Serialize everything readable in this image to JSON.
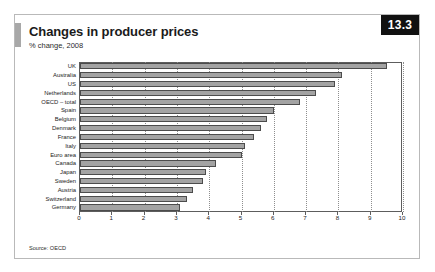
{
  "figure": {
    "badge": "13.3",
    "title": "Changes in producer prices",
    "subtitle": "% change, 2008",
    "source": "Source: OECD"
  },
  "chart_data": {
    "type": "bar",
    "orientation": "horizontal",
    "title": "Changes in producer prices",
    "subtitle": "% change, 2008",
    "xlabel": "",
    "ylabel": "",
    "xlim": [
      0,
      10
    ],
    "xticks": [
      0,
      1,
      2,
      3,
      4,
      5,
      6,
      7,
      8,
      9,
      10
    ],
    "xtick_labels": [
      "0",
      "1",
      "2",
      "3",
      "4",
      "5",
      "6",
      "7",
      "8",
      "9",
      "10"
    ],
    "grid": true,
    "grid_axis": "x",
    "legend": false,
    "bar_color": "#a3a3a3",
    "bar_edge_color": "#4c4c4c",
    "categories": [
      "UK",
      "Australia",
      "US",
      "Netherlands",
      "OECD – total",
      "Spain",
      "Belgium",
      "Denmark",
      "France",
      "Italy",
      "Euro area",
      "Canada",
      "Japan",
      "Sweden",
      "Austria",
      "Switzerland",
      "Germany"
    ],
    "values": [
      9.5,
      8.1,
      7.9,
      7.3,
      6.8,
      6.0,
      5.8,
      5.6,
      5.4,
      5.1,
      5.0,
      4.2,
      3.9,
      3.8,
      3.5,
      3.3,
      3.1
    ],
    "value_unit": "%"
  }
}
